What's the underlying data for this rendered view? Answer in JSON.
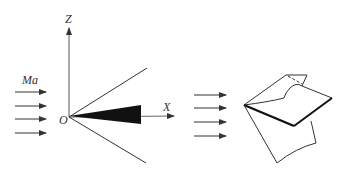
{
  "left_diagram": {
    "axis_z_label": "Z",
    "axis_x_label": "X",
    "origin_label": "O",
    "flow_label": "Ma",
    "flow_arrow_count": 4
  },
  "right_diagram": {
    "flow_arrow_count": 4
  },
  "colors": {
    "line": "#333333",
    "fill": "#111111",
    "background": "#ffffff"
  }
}
